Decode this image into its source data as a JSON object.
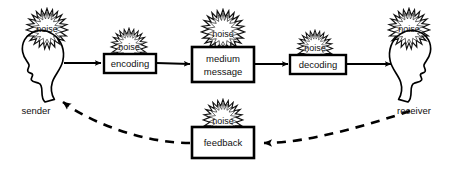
{
  "diagram": {
    "background_color": "#ffffff",
    "stroke_color": "#000000",
    "noise_color": "#1a1a1a",
    "actors": [
      {
        "id": "sender",
        "label": "sender",
        "facing": "right",
        "noise_label": "noise"
      },
      {
        "id": "receiver",
        "label": "receiver",
        "facing": "left",
        "noise_label": "noise"
      }
    ],
    "boxes": [
      {
        "id": "encoding",
        "lines": [
          "encoding"
        ],
        "noise_label": "noise"
      },
      {
        "id": "medium",
        "lines": [
          "medium",
          "message"
        ],
        "noise_label": "noise"
      },
      {
        "id": "decoding",
        "lines": [
          "decoding"
        ],
        "noise_label": "noise"
      },
      {
        "id": "feedback",
        "lines": [
          "feedback"
        ],
        "noise_label": "noise"
      }
    ],
    "connections": [
      {
        "id": "sender-to-encoding",
        "style": "solid",
        "arrow": "end"
      },
      {
        "id": "encoding-to-medium",
        "style": "solid",
        "arrow": "end"
      },
      {
        "id": "medium-to-decoding",
        "style": "solid",
        "arrow": "end"
      },
      {
        "id": "decoding-to-receiver",
        "style": "solid",
        "arrow": "end"
      },
      {
        "id": "receiver-to-feedback",
        "style": "dashed",
        "arrow": "end"
      },
      {
        "id": "feedback-to-sender",
        "style": "dashed",
        "arrow": "end"
      }
    ],
    "labels": {
      "encoding": "encoding",
      "medium_line1": "medium",
      "medium_line2": "message",
      "decoding": "decoding",
      "feedback": "feedback",
      "sender": "sender",
      "receiver": "receiver",
      "noise_sender": "noise",
      "noise_encoding": "noise",
      "noise_medium": "noise",
      "noise_decoding": "noise",
      "noise_receiver": "noise",
      "noise_feedback": "noise"
    }
  }
}
